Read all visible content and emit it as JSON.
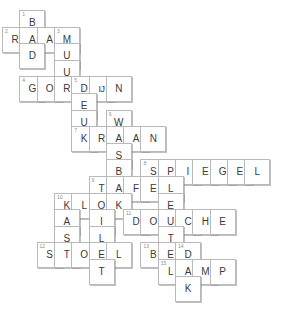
{
  "puzzle": {
    "type": "crossword-grid",
    "columns": 11,
    "rows": 12,
    "cell_size": 26,
    "origin_x": 2,
    "origin_y": 10,
    "colors": {
      "cell_border": "#b9b9b9",
      "cell_background": "#ffffff",
      "letter": "#3b3b3b",
      "number": "#8e8e8e",
      "page_background": "#ffffff"
    },
    "cells": [
      {
        "col": 1,
        "row": 0,
        "letter": "B",
        "num": "1"
      },
      {
        "col": 0,
        "row": 1,
        "letter": "R",
        "num": "2"
      },
      {
        "col": 1,
        "row": 1,
        "letter": "A",
        "num": ""
      },
      {
        "col": 2,
        "row": 1,
        "letter": "A",
        "num": ""
      },
      {
        "col": 3,
        "row": 1,
        "letter": "M",
        "num": "3"
      },
      {
        "col": 1,
        "row": 2,
        "letter": "D",
        "num": ""
      },
      {
        "col": 3,
        "row": 2,
        "letter": "U",
        "num": ""
      },
      {
        "col": 3,
        "row": 3,
        "letter": "U",
        "num": ""
      },
      {
        "col": 1,
        "row": 4,
        "letter": "G",
        "num": "4"
      },
      {
        "col": 2,
        "row": 4,
        "letter": "O",
        "num": ""
      },
      {
        "col": 3,
        "row": 4,
        "letter": "R",
        "num": ""
      },
      {
        "col": 4,
        "row": 4,
        "letter": "D",
        "num": "5"
      },
      {
        "col": 5,
        "row": 4,
        "letter": "IJ",
        "num": ""
      },
      {
        "col": 6,
        "row": 4,
        "letter": "N",
        "num": ""
      },
      {
        "col": 4,
        "row": 5,
        "letter": "E",
        "num": ""
      },
      {
        "col": 4,
        "row": 6,
        "letter": "U",
        "num": ""
      },
      {
        "col": 6,
        "row": 6,
        "letter": "W",
        "num": "6"
      },
      {
        "col": 4,
        "row": 7,
        "letter": "K",
        "num": "7"
      },
      {
        "col": 5,
        "row": 7,
        "letter": "R",
        "num": ""
      },
      {
        "col": 6,
        "row": 7,
        "letter": "A",
        "num": ""
      },
      {
        "col": 7,
        "row": 7,
        "letter": "A",
        "num": ""
      },
      {
        "col": 8,
        "row": 7,
        "letter": "N",
        "num": ""
      },
      {
        "col": 6,
        "row": 8,
        "letter": "S",
        "num": ""
      },
      {
        "col": 6,
        "row": 9,
        "letter": "B",
        "num": ""
      },
      {
        "col": 8,
        "row": 9,
        "letter": "S",
        "num": "8"
      },
      {
        "col": 9,
        "row": 9,
        "letter": "P",
        "num": ""
      },
      {
        "col": 10,
        "row": 9,
        "letter": "I",
        "num": ""
      },
      {
        "col": 11,
        "row": 9,
        "letter": "E",
        "num": ""
      },
      {
        "col": 12,
        "row": 9,
        "letter": "G",
        "num": ""
      },
      {
        "col": 13,
        "row": 9,
        "letter": "E",
        "num": ""
      },
      {
        "col": 14,
        "row": 9,
        "letter": "L",
        "num": ""
      },
      {
        "col": 5,
        "row": 10,
        "letter": "T",
        "num": "9"
      },
      {
        "col": 6,
        "row": 10,
        "letter": "A",
        "num": ""
      },
      {
        "col": 7,
        "row": 10,
        "letter": "F",
        "num": ""
      },
      {
        "col": 8,
        "row": 10,
        "letter": "E",
        "num": ""
      },
      {
        "col": 9,
        "row": 10,
        "letter": "L",
        "num": ""
      },
      {
        "col": 3,
        "row": 11,
        "letter": "K",
        "num": "10"
      },
      {
        "col": 4,
        "row": 11,
        "letter": "L",
        "num": ""
      },
      {
        "col": 5,
        "row": 11,
        "letter": "O",
        "num": ""
      },
      {
        "col": 6,
        "row": 11,
        "letter": "K",
        "num": ""
      },
      {
        "col": 9,
        "row": 11,
        "letter": "E",
        "num": ""
      },
      {
        "col": 3,
        "row": 12,
        "letter": "A",
        "num": ""
      },
      {
        "col": 5,
        "row": 12,
        "letter": "I",
        "num": ""
      },
      {
        "col": 7,
        "row": 12,
        "letter": "D",
        "num": "11"
      },
      {
        "col": 8,
        "row": 12,
        "letter": "O",
        "num": ""
      },
      {
        "col": 9,
        "row": 12,
        "letter": "U",
        "num": ""
      },
      {
        "col": 10,
        "row": 12,
        "letter": "C",
        "num": ""
      },
      {
        "col": 11,
        "row": 12,
        "letter": "H",
        "num": ""
      },
      {
        "col": 12,
        "row": 12,
        "letter": "E",
        "num": ""
      },
      {
        "col": 3,
        "row": 13,
        "letter": "S",
        "num": ""
      },
      {
        "col": 5,
        "row": 13,
        "letter": "L",
        "num": ""
      },
      {
        "col": 9,
        "row": 13,
        "letter": "T",
        "num": ""
      },
      {
        "col": 2,
        "row": 14,
        "letter": "S",
        "num": "12"
      },
      {
        "col": 3,
        "row": 14,
        "letter": "T",
        "num": ""
      },
      {
        "col": 4,
        "row": 14,
        "letter": "O",
        "num": ""
      },
      {
        "col": 5,
        "row": 14,
        "letter": "E",
        "num": ""
      },
      {
        "col": 6,
        "row": 14,
        "letter": "L",
        "num": ""
      },
      {
        "col": 8,
        "row": 14,
        "letter": "B",
        "num": "13"
      },
      {
        "col": 9,
        "row": 14,
        "letter": "E",
        "num": ""
      },
      {
        "col": 10,
        "row": 14,
        "letter": "D",
        "num": "14"
      },
      {
        "col": 5,
        "row": 15,
        "letter": "T",
        "num": ""
      },
      {
        "col": 9,
        "row": 15,
        "letter": "L",
        "num": "15"
      },
      {
        "col": 10,
        "row": 15,
        "letter": "A",
        "num": ""
      },
      {
        "col": 11,
        "row": 15,
        "letter": "M",
        "num": ""
      },
      {
        "col": 12,
        "row": 15,
        "letter": "P",
        "num": ""
      },
      {
        "col": 10,
        "row": 16,
        "letter": "K",
        "num": ""
      }
    ],
    "words": {
      "across": [
        {
          "number": "2",
          "answer": "RAAM"
        },
        {
          "number": "4",
          "answer": "GORDIJN"
        },
        {
          "number": "7",
          "answer": "KRAAN"
        },
        {
          "number": "8",
          "answer": "SPIEGEL"
        },
        {
          "number": "9",
          "answer": "TAFEL"
        },
        {
          "number": "10",
          "answer": "KLOK"
        },
        {
          "number": "11",
          "answer": "DOUCHE"
        },
        {
          "number": "12",
          "answer": "STOEL"
        },
        {
          "number": "13",
          "answer": "BED"
        },
        {
          "number": "15",
          "answer": "LAMP"
        }
      ],
      "down": [
        {
          "number": "1",
          "answer": "BAD"
        },
        {
          "number": "3",
          "answer": "MUUR"
        },
        {
          "number": "5",
          "answer": "DEUR"
        },
        {
          "number": "6",
          "answer": "WASBAK"
        },
        {
          "number": "8",
          "answer": "SLEUTEL"
        },
        {
          "number": "10",
          "answer": "KAST"
        },
        {
          "number": "9",
          "answer": "TOILET"
        },
        {
          "number": "14",
          "answer": "DEK"
        }
      ]
    }
  }
}
